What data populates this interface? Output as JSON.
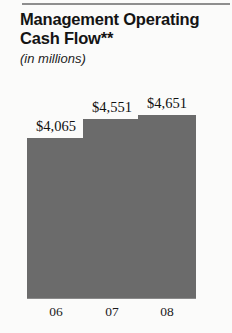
{
  "chart_data": {
    "type": "bar",
    "title": "Management Operating\nCash Flow**",
    "subtitle": "(in millions)",
    "xlabel": "",
    "ylabel": "",
    "categories": [
      "06",
      "07",
      "08"
    ],
    "values": [
      4065,
      4551,
      4651
    ],
    "value_labels": [
      "$4,065",
      "$4,551",
      "$4,651"
    ],
    "ylim": [
      0,
      5400
    ],
    "grid": false,
    "legend": "none",
    "bar_color": "#6b6b6b",
    "units": "millions of dollars"
  },
  "styling": {
    "background": "#fbfbfa",
    "rule_color": "#8e8e8e",
    "text_color": "#141414"
  }
}
